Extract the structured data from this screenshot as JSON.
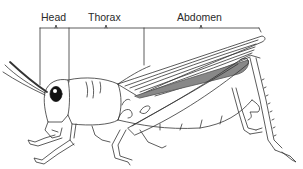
{
  "diagram": {
    "labels": [
      {
        "id": "head",
        "text": "Head",
        "x": 41,
        "y": 12
      },
      {
        "id": "thorax",
        "text": "Thorax",
        "x": 88,
        "y": 12
      },
      {
        "id": "abdomen",
        "text": "Abdomen",
        "x": 177,
        "y": 12
      }
    ],
    "colors": {
      "stroke": "#333333",
      "background": "#ffffff",
      "eye": "#111111"
    }
  }
}
